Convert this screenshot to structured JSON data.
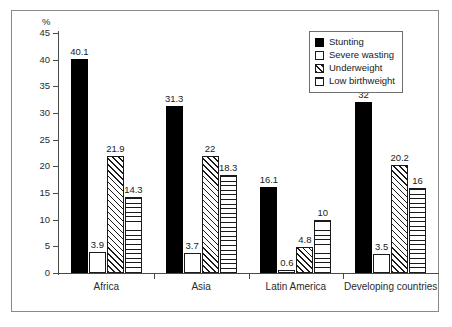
{
  "chart_data": {
    "type": "bar",
    "title": "",
    "xlabel": "",
    "ylabel": "%",
    "ylim": [
      0,
      45
    ],
    "yticks": [
      0,
      5,
      10,
      15,
      20,
      25,
      30,
      35,
      40,
      45
    ],
    "ytick_labels": [
      "0",
      "5",
      "10",
      "15",
      "20",
      "25",
      "30",
      "35",
      "40",
      "45"
    ],
    "grid": false,
    "legend_position": "top-right",
    "categories": [
      "Africa",
      "Asia",
      "Latin America",
      "Developing countries"
    ],
    "series": [
      {
        "name": "Stunting",
        "pattern": "solid-black",
        "values": [
          40.1,
          31.3,
          16.1,
          32
        ],
        "labels": [
          "40.1",
          "31.3",
          "16.1",
          "32"
        ]
      },
      {
        "name": "Severe wasting",
        "pattern": "empty-white",
        "values": [
          3.9,
          3.7,
          0.6,
          3.5
        ],
        "labels": [
          "3.9",
          "3.7",
          "0.6",
          "3.5"
        ]
      },
      {
        "name": "Underweight",
        "pattern": "diagonal-hatch",
        "values": [
          21.9,
          22,
          4.8,
          20.2
        ],
        "labels": [
          "21.9",
          "22",
          "4.8",
          "20.2"
        ]
      },
      {
        "name": "Low birthweight",
        "pattern": "horizontal-lines",
        "values": [
          14.3,
          18.3,
          10,
          16
        ],
        "labels": [
          "14.3",
          "18.3",
          "10",
          "16"
        ]
      }
    ]
  },
  "axis": {
    "unit_label": "%"
  },
  "legend": {
    "items": [
      {
        "label": "Stunting"
      },
      {
        "label": "Severe wasting"
      },
      {
        "label": "Underweight"
      },
      {
        "label": "Low birthweight"
      }
    ]
  },
  "colors": {
    "bar_fill_solid": "#000000",
    "bar_outline": "#1a1a1a",
    "axis": "#4a4a4a",
    "frame": "#8a8a8a",
    "text": "#1a1a1a",
    "background": "#ffffff"
  }
}
